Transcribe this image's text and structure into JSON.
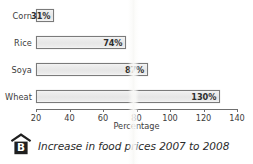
{
  "chart_data": {
    "type": "bar",
    "orientation": "horizontal",
    "title": "",
    "categories": [
      "Corn",
      "Rice",
      "Soya",
      "Wheat"
    ],
    "values": [
      31,
      74,
      87,
      130
    ],
    "value_labels": [
      "31%",
      "74%",
      "87%",
      "130%"
    ],
    "xlabel": "Percentage",
    "ylabel": "",
    "xlim": [
      20,
      140
    ],
    "xticks": [
      20,
      40,
      60,
      80,
      100,
      120,
      140
    ],
    "xtick_labels": [
      "20",
      "40",
      "60",
      "80",
      "100",
      "120",
      "140"
    ],
    "grid": false,
    "legend": null,
    "bar_fill_color": "#ebebeb",
    "bar_border_color": "#7a7a7a",
    "text_color": "#3c3c3c"
  },
  "caption": {
    "icon": "house-b-icon",
    "icon_letter": "B",
    "text": "Increase in food prices 2007 to 2008"
  }
}
